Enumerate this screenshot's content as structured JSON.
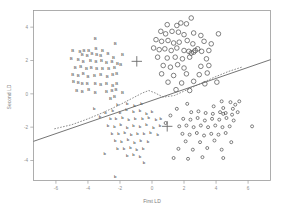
{
  "chart_data": {
    "type": "scatter",
    "title": "",
    "xlabel": "First LD",
    "ylabel": "Second LD",
    "xlim": [
      -7.4,
      7.4
    ],
    "ylim": [
      -5.2,
      5.0
    ],
    "xticks": [
      -6,
      -4,
      -2,
      0,
      2,
      4,
      6
    ],
    "xticklabels": [
      "-6",
      "-4",
      "-2",
      "0",
      "2",
      "4",
      "6"
    ],
    "yticks": [
      4,
      2,
      0,
      -2,
      -4
    ],
    "yticklabels": [
      "4",
      "2",
      "0",
      "-2",
      "-4"
    ],
    "grid": false,
    "legend": null,
    "series": [
      {
        "name": "B",
        "marker": "text-B",
        "points": [
          [
            -3.55,
            3.35
          ],
          [
            -2.3,
            3.05
          ],
          [
            -4.95,
            2.6
          ],
          [
            -4.5,
            2.55
          ],
          [
            -4.25,
            2.6
          ],
          [
            -3.95,
            2.6
          ],
          [
            -3.5,
            2.7
          ],
          [
            -3.1,
            2.6
          ],
          [
            -4.35,
            2.35
          ],
          [
            -4.05,
            2.3
          ],
          [
            -3.75,
            2.4
          ],
          [
            -3.45,
            2.35
          ],
          [
            -3.2,
            2.3
          ],
          [
            -2.75,
            2.45
          ],
          [
            -2.4,
            2.2
          ],
          [
            -5.05,
            2.1
          ],
          [
            -4.6,
            2.05
          ],
          [
            -4.3,
            1.95
          ],
          [
            -3.85,
            2.0
          ],
          [
            -3.5,
            1.95
          ],
          [
            -3.15,
            2.0
          ],
          [
            -2.85,
            1.9
          ],
          [
            -2.5,
            1.95
          ],
          [
            -4.8,
            1.6
          ],
          [
            -4.45,
            1.65
          ],
          [
            -4.1,
            1.55
          ],
          [
            -3.8,
            1.6
          ],
          [
            -3.45,
            1.5
          ],
          [
            -3.1,
            1.55
          ],
          [
            -2.7,
            1.5
          ],
          [
            -2.35,
            1.6
          ],
          [
            -2.15,
            1.85
          ],
          [
            -4.95,
            1.15
          ],
          [
            -4.6,
            1.1
          ],
          [
            -4.3,
            1.2
          ],
          [
            -4.0,
            1.05
          ],
          [
            -3.6,
            1.1
          ],
          [
            -3.2,
            1.15
          ],
          [
            -2.8,
            1.05
          ],
          [
            -2.45,
            1.15
          ],
          [
            -2.2,
            1.25
          ],
          [
            -4.9,
            0.75
          ],
          [
            -4.6,
            0.7
          ],
          [
            -4.35,
            0.6
          ],
          [
            -4.05,
            0.65
          ],
          [
            -3.55,
            0.6
          ],
          [
            -3.2,
            0.55
          ],
          [
            -2.85,
            0.6
          ],
          [
            -2.45,
            0.5
          ],
          [
            -2.2,
            0.6
          ],
          [
            -4.7,
            0.2
          ],
          [
            -4.35,
            0.15
          ],
          [
            -3.95,
            0.25
          ],
          [
            -3.55,
            0.1
          ],
          [
            -2.85,
            0.15
          ],
          [
            -2.5,
            0.2
          ],
          [
            -2.25,
            0.25
          ],
          [
            -2.35,
            -0.15
          ],
          [
            -2.6,
            -0.3
          ],
          [
            -1.85,
            0.1
          ],
          [
            -1.95,
            1.75
          ],
          [
            -1.85,
            2.35
          ]
        ]
      },
      {
        "name": "o-large",
        "marker": "circle-open",
        "points": [
          [
            2.45,
            4.55
          ],
          [
            0.95,
            4.15
          ],
          [
            1.55,
            4.1
          ],
          [
            1.8,
            4.25
          ],
          [
            2.15,
            4.2
          ],
          [
            0.55,
            3.75
          ],
          [
            0.85,
            3.6
          ],
          [
            1.25,
            3.75
          ],
          [
            1.65,
            3.7
          ],
          [
            2.0,
            3.55
          ],
          [
            2.6,
            3.65
          ],
          [
            3.05,
            3.5
          ],
          [
            4.15,
            3.6
          ],
          [
            0.25,
            3.25
          ],
          [
            0.6,
            3.15
          ],
          [
            1.0,
            3.2
          ],
          [
            1.35,
            3.05
          ],
          [
            1.7,
            3.1
          ],
          [
            2.2,
            3.2
          ],
          [
            2.55,
            3.0
          ],
          [
            3.25,
            3.15
          ],
          [
            3.7,
            3.0
          ],
          [
            0.1,
            2.75
          ],
          [
            0.45,
            2.65
          ],
          [
            0.8,
            2.7
          ],
          [
            1.2,
            2.6
          ],
          [
            1.55,
            2.75
          ],
          [
            2.0,
            2.6
          ],
          [
            2.3,
            2.55
          ],
          [
            2.45,
            2.45
          ],
          [
            2.6,
            2.5
          ],
          [
            2.7,
            2.6
          ],
          [
            2.85,
            2.7
          ],
          [
            3.1,
            2.55
          ],
          [
            3.55,
            2.6
          ],
          [
            0.35,
            2.2
          ],
          [
            0.95,
            2.15
          ],
          [
            1.45,
            2.2
          ],
          [
            1.9,
            2.1
          ],
          [
            2.35,
            2.2
          ],
          [
            3.4,
            2.1
          ],
          [
            0.7,
            1.7
          ],
          [
            1.15,
            1.6
          ],
          [
            1.6,
            1.75
          ],
          [
            2.0,
            1.55
          ],
          [
            3.05,
            1.65
          ],
          [
            3.55,
            1.7
          ],
          [
            0.6,
            1.2
          ],
          [
            1.35,
            1.1
          ],
          [
            2.15,
            1.2
          ],
          [
            2.95,
            1.15
          ],
          [
            3.45,
            1.25
          ],
          [
            1.0,
            0.7
          ],
          [
            1.85,
            0.65
          ],
          [
            2.6,
            0.75
          ],
          [
            3.3,
            0.6
          ],
          [
            4.05,
            0.7
          ],
          [
            1.5,
            0.25
          ],
          [
            2.35,
            0.2
          ]
        ]
      },
      {
        "name": "b",
        "marker": "text-b",
        "points": [
          [
            -2.15,
            -0.65
          ],
          [
            -1.55,
            -0.55
          ],
          [
            -1.1,
            -0.7
          ],
          [
            -0.65,
            -0.6
          ],
          [
            -2.45,
            -1.0
          ],
          [
            -2.0,
            -1.1
          ],
          [
            -1.6,
            -0.95
          ],
          [
            -1.15,
            -1.05
          ],
          [
            -0.75,
            -1.0
          ],
          [
            -0.35,
            -1.15
          ],
          [
            0.0,
            -1.05
          ],
          [
            -2.6,
            -1.45
          ],
          [
            -2.25,
            -1.5
          ],
          [
            -1.85,
            -1.4
          ],
          [
            -1.45,
            -1.55
          ],
          [
            -1.05,
            -1.45
          ],
          [
            -0.6,
            -1.5
          ],
          [
            -0.2,
            -1.4
          ],
          [
            0.25,
            -1.55
          ],
          [
            0.55,
            -1.45
          ],
          [
            -2.75,
            -1.9
          ],
          [
            -2.35,
            -1.95
          ],
          [
            -1.95,
            -1.85
          ],
          [
            -1.55,
            -2.0
          ],
          [
            -1.15,
            -1.9
          ],
          [
            -0.75,
            -1.95
          ],
          [
            -0.35,
            -1.85
          ],
          [
            0.1,
            -2.0
          ],
          [
            0.5,
            -1.9
          ],
          [
            -2.5,
            -2.35
          ],
          [
            -2.1,
            -2.4
          ],
          [
            -1.7,
            -2.3
          ],
          [
            -1.3,
            -2.45
          ],
          [
            -0.9,
            -2.35
          ],
          [
            -0.5,
            -2.4
          ],
          [
            -0.1,
            -2.3
          ],
          [
            0.35,
            -2.45
          ],
          [
            -2.3,
            -2.8
          ],
          [
            -1.9,
            -2.85
          ],
          [
            -1.5,
            -2.75
          ],
          [
            -1.1,
            -2.9
          ],
          [
            -0.7,
            -2.8
          ],
          [
            -0.25,
            -2.85
          ],
          [
            -2.15,
            -3.25
          ],
          [
            -1.75,
            -3.3
          ],
          [
            -1.35,
            -3.2
          ],
          [
            -0.95,
            -3.35
          ],
          [
            -0.55,
            -3.25
          ],
          [
            -1.55,
            -3.7
          ],
          [
            -1.15,
            -3.65
          ],
          [
            -0.75,
            -3.75
          ],
          [
            -0.5,
            -4.1
          ],
          [
            -2.95,
            -3.6
          ],
          [
            -3.6,
            -0.9
          ],
          [
            -3.25,
            -1.35
          ],
          [
            -2.9,
            -1.1
          ],
          [
            -2.3,
            -4.95
          ]
        ]
      },
      {
        "name": "o-small",
        "marker": "circle-small",
        "points": [
          [
            4.35,
            -0.45
          ],
          [
            4.9,
            -0.5
          ],
          [
            5.2,
            -0.65
          ],
          [
            3.85,
            -0.75
          ],
          [
            4.45,
            -0.85
          ],
          [
            5.05,
            -0.9
          ],
          [
            2.45,
            -1.1
          ],
          [
            2.9,
            -1.05
          ],
          [
            3.35,
            -1.15
          ],
          [
            3.8,
            -1.2
          ],
          [
            4.25,
            -1.1
          ],
          [
            4.45,
            -1.2
          ],
          [
            4.6,
            -1.15
          ],
          [
            5.0,
            -1.25
          ],
          [
            5.35,
            -1.1
          ],
          [
            1.95,
            -1.5
          ],
          [
            2.4,
            -1.55
          ],
          [
            2.85,
            -1.45
          ],
          [
            3.3,
            -1.6
          ],
          [
            3.75,
            -1.5
          ],
          [
            4.2,
            -1.55
          ],
          [
            4.65,
            -1.45
          ],
          [
            5.1,
            -1.6
          ],
          [
            1.7,
            -1.95
          ],
          [
            2.15,
            -1.9
          ],
          [
            2.6,
            -2.0
          ],
          [
            3.05,
            -1.9
          ],
          [
            3.5,
            -2.0
          ],
          [
            3.95,
            -1.9
          ],
          [
            4.4,
            -2.0
          ],
          [
            4.85,
            -1.95
          ],
          [
            6.25,
            -1.95
          ],
          [
            1.9,
            -2.4
          ],
          [
            2.35,
            -2.45
          ],
          [
            2.8,
            -2.35
          ],
          [
            3.25,
            -2.5
          ],
          [
            3.7,
            -2.4
          ],
          [
            4.15,
            -2.45
          ],
          [
            4.6,
            -2.35
          ],
          [
            2.1,
            -2.85
          ],
          [
            3.0,
            -2.9
          ],
          [
            3.9,
            -2.8
          ],
          [
            4.95,
            -2.9
          ],
          [
            1.65,
            -3.3
          ],
          [
            2.55,
            -3.35
          ],
          [
            3.45,
            -3.25
          ],
          [
            4.35,
            -3.35
          ],
          [
            1.35,
            -3.85
          ],
          [
            2.25,
            -3.9
          ],
          [
            3.15,
            -3.8
          ],
          [
            4.45,
            -3.85
          ],
          [
            5.45,
            -0.45
          ],
          [
            2.2,
            -0.6
          ],
          [
            1.55,
            -0.9
          ],
          [
            1.15,
            -1.3
          ],
          [
            0.85,
            -1.75
          ]
        ]
      }
    ],
    "centroids": [
      {
        "label": "+",
        "x": -0.95,
        "y": 1.95
      },
      {
        "label": "+",
        "x": 0.95,
        "y": -1.95
      }
    ],
    "boundary_solid": {
      "style": "solid",
      "description": "linear discriminant boundary",
      "x": [
        -7.4,
        7.4
      ],
      "y": [
        -2.85,
        2.05
      ]
    },
    "boundary_dashed": {
      "style": "dashed",
      "description": "quadratic / nonparametric boundary",
      "x": [
        -6.1,
        -5.0,
        -4.0,
        -3.0,
        -2.0,
        -1.2,
        -0.6,
        -0.2,
        0.2,
        0.7,
        1.4,
        2.2,
        3.0,
        3.9,
        4.8,
        5.6
      ],
      "y": [
        -2.1,
        -1.85,
        -1.5,
        -1.1,
        -0.65,
        -0.25,
        0.05,
        0.2,
        0.05,
        -0.2,
        -0.1,
        0.25,
        0.6,
        1.0,
        1.35,
        1.6
      ]
    }
  }
}
